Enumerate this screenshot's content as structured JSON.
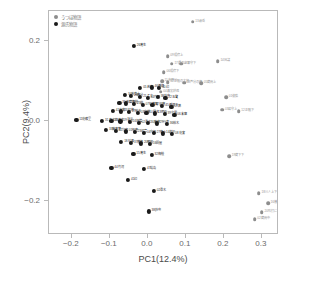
{
  "chart_data": {
    "type": "scatter",
    "title": "",
    "xlabel": "PC1(12.4%)",
    "ylabel": "PC2(9.4%)",
    "xlim": [
      -0.26,
      0.345
    ],
    "ylim": [
      -0.285,
      0.275
    ],
    "xticks": [
      -0.2,
      -0.1,
      0.0,
      0.1,
      0.2,
      0.3
    ],
    "xticklabels": [
      "−0.2",
      "−0.1",
      "0.0",
      "0.1",
      "0.2",
      "0.3"
    ],
    "yticks": [
      0.2,
      0.0,
      -0.2
    ],
    "yticklabels": [
      "0.2",
      "0.0",
      "−0.2"
    ],
    "grid": false,
    "legend_position": "top-left",
    "series": [
      {
        "name": "うつほ物語",
        "color": "#8d8d8d",
        "points": [
          {
            "x": 0.118,
            "y": 0.248,
            "label": "13嵌岳"
          },
          {
            "x": 0.052,
            "y": 0.162,
            "label": "09規宿上"
          },
          {
            "x": 0.063,
            "y": 0.143,
            "label": "17樓の上下"
          },
          {
            "x": 0.088,
            "y": 0.143,
            "label": "07君守下"
          },
          {
            "x": 0.042,
            "y": 0.122,
            "label": "06規宿下"
          },
          {
            "x": 0.037,
            "y": 0.099,
            "label": "11吉野川"
          },
          {
            "x": 0.052,
            "y": 0.097,
            "label": "12正頼の大将"
          },
          {
            "x": 0.095,
            "y": 0.096,
            "label": "08芦分の使"
          },
          {
            "x": 0.14,
            "y": 0.095,
            "label": "05蔵開上"
          },
          {
            "x": 0.034,
            "y": 0.073,
            "label": "04義実辞退"
          },
          {
            "x": 0.184,
            "y": 0.15,
            "label": "14国譲"
          },
          {
            "x": 0.206,
            "y": 0.06,
            "label": "01俊蔭"
          },
          {
            "x": 0.239,
            "y": 0.024,
            "label": "12正頼下"
          },
          {
            "x": 0.196,
            "y": 0.028,
            "label": "03君守上"
          },
          {
            "x": 0.214,
            "y": -0.088,
            "label": "19蔵下下"
          },
          {
            "x": 0.292,
            "y": -0.181,
            "label": "18川人上下"
          },
          {
            "x": 0.316,
            "y": -0.205,
            "label": "16楼の上上"
          },
          {
            "x": 0.3,
            "y": -0.228,
            "label": "20吹打に上"
          },
          {
            "x": 0.281,
            "y": -0.245,
            "label": "02蔵開中"
          }
        ]
      },
      {
        "name": "源氏物語",
        "color": "#1a1a1a",
        "points": [
          {
            "x": -0.037,
            "y": 0.188,
            "label": "26蓬生"
          },
          {
            "x": -0.02,
            "y": 0.083,
            "label": "05若紫"
          },
          {
            "x": 0.01,
            "y": 0.084,
            "label": "46橋姫"
          },
          {
            "x": 0.03,
            "y": 0.082,
            "label": "40幻"
          },
          {
            "x": -0.06,
            "y": 0.066,
            "label": "34若菜上"
          },
          {
            "x": -0.044,
            "y": 0.063,
            "label": "28野分"
          },
          {
            "x": -0.02,
            "y": 0.06,
            "label": "21乙女"
          },
          {
            "x": 0.0,
            "y": 0.058,
            "label": "44竹河"
          },
          {
            "x": 0.026,
            "y": 0.06,
            "label": "38鈴虫"
          },
          {
            "x": 0.046,
            "y": 0.058,
            "label": "22玉鬘"
          },
          {
            "x": -0.075,
            "y": 0.046,
            "label": "35若菜下"
          },
          {
            "x": -0.058,
            "y": 0.044,
            "label": "32梅枝"
          },
          {
            "x": -0.036,
            "y": 0.042,
            "label": "25螢"
          },
          {
            "x": -0.014,
            "y": 0.04,
            "label": "07紅葉賀"
          },
          {
            "x": 0.012,
            "y": 0.041,
            "label": "12須磨"
          },
          {
            "x": 0.038,
            "y": 0.038,
            "label": "45橋姫下"
          },
          {
            "x": 0.062,
            "y": 0.036,
            "label": "09葵"
          },
          {
            "x": -0.092,
            "y": 0.026,
            "label": "41花宴"
          },
          {
            "x": -0.07,
            "y": 0.024,
            "label": "43紅梅"
          },
          {
            "x": -0.05,
            "y": 0.022,
            "label": "17絵合"
          },
          {
            "x": -0.026,
            "y": 0.02,
            "label": "03空蝉"
          },
          {
            "x": -0.004,
            "y": 0.02,
            "label": "10賢木"
          },
          {
            "x": 0.018,
            "y": 0.019,
            "label": "13明石"
          },
          {
            "x": 0.044,
            "y": 0.018,
            "label": "39夕霧"
          },
          {
            "x": 0.07,
            "y": 0.016,
            "label": "06末摩"
          },
          {
            "x": -0.188,
            "y": 0.002,
            "label": "11花散里"
          },
          {
            "x": -0.12,
            "y": 0.001,
            "label": "31真木柱"
          },
          {
            "x": -0.096,
            "y": 0.0,
            "label": "15蓬生"
          },
          {
            "x": -0.072,
            "y": -0.001,
            "label": "19薄雲"
          },
          {
            "x": -0.048,
            "y": -0.002,
            "label": "24胡蝶"
          },
          {
            "x": -0.024,
            "y": -0.004,
            "label": "02帚木"
          },
          {
            "x": 0.0,
            "y": -0.004,
            "label": "30藤裴"
          },
          {
            "x": 0.024,
            "y": -0.006,
            "label": "29行幸"
          },
          {
            "x": 0.05,
            "y": -0.007,
            "label": "36柏木"
          },
          {
            "x": -0.11,
            "y": -0.022,
            "label": "33藤裏葉"
          },
          {
            "x": -0.084,
            "y": -0.024,
            "label": "42匀宮"
          },
          {
            "x": -0.058,
            "y": -0.026,
            "label": "01桐壺"
          },
          {
            "x": -0.034,
            "y": -0.028,
            "label": "23初音"
          },
          {
            "x": -0.01,
            "y": -0.029,
            "label": "04夕顔"
          },
          {
            "x": 0.016,
            "y": -0.03,
            "label": "27篠火"
          },
          {
            "x": 0.04,
            "y": -0.031,
            "label": "14激標"
          },
          {
            "x": 0.064,
            "y": -0.032,
            "label": "08花宴"
          },
          {
            "x": -0.07,
            "y": -0.052,
            "label": "18松風"
          },
          {
            "x": -0.044,
            "y": -0.054,
            "label": "37横笛"
          },
          {
            "x": -0.018,
            "y": -0.056,
            "label": "20朝顔"
          },
          {
            "x": 0.006,
            "y": -0.058,
            "label": "16関屋"
          },
          {
            "x": -0.038,
            "y": -0.082,
            "label": "15蓬生"
          },
          {
            "x": 0.01,
            "y": -0.084,
            "label": "32梅枝"
          },
          {
            "x": -0.096,
            "y": -0.118,
            "label": "44竹河"
          },
          {
            "x": -0.01,
            "y": -0.12,
            "label": "47総角"
          },
          {
            "x": -0.052,
            "y": -0.148,
            "label": "41幻"
          },
          {
            "x": 0.016,
            "y": -0.174,
            "label": "02帚木"
          },
          {
            "x": 0.002,
            "y": -0.226,
            "label": "38鈴虫"
          }
        ]
      }
    ]
  }
}
